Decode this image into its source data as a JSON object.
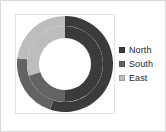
{
  "chart_data": {
    "type": "pie",
    "subtype": "doughnut",
    "title": "",
    "xlabel": "",
    "ylabel": "",
    "grid": false,
    "legend_position": "right",
    "categories": [
      "North",
      "South",
      "East"
    ],
    "colors": {
      "North": "#3b3b3b",
      "South": "#636363",
      "East": "#bdbdbd"
    },
    "rings": [
      {
        "name": "Outer ring",
        "start_angle": 0,
        "values": [
          55,
          22,
          23
        ],
        "slices": [
          {
            "label": "North",
            "value": 55,
            "percent": 55,
            "color": "#3b3b3b",
            "start_deg": 0,
            "end_deg": 198
          },
          {
            "label": "South",
            "value": 22,
            "percent": 22,
            "color": "#636363",
            "start_deg": 198,
            "end_deg": 277
          },
          {
            "label": "East",
            "value": 23,
            "percent": 23,
            "color": "#bdbdbd",
            "start_deg": 277,
            "end_deg": 360
          }
        ]
      },
      {
        "name": "Inner ring",
        "start_angle": 0,
        "values": [
          50,
          20,
          30
        ],
        "slices": [
          {
            "label": "North",
            "value": 50,
            "percent": 50,
            "color": "#3b3b3b",
            "start_deg": 0,
            "end_deg": 180
          },
          {
            "label": "South",
            "value": 20,
            "percent": 20,
            "color": "#636363",
            "start_deg": 180,
            "end_deg": 252
          },
          {
            "label": "East",
            "value": 30,
            "percent": 30,
            "color": "#bdbdbd",
            "start_deg": 252,
            "end_deg": 360
          }
        ]
      }
    ],
    "geometry": {
      "center_x": 50,
      "center_y": 50,
      "outer_radius": 48,
      "ring_split_radius": 38,
      "inner_radius": 26
    }
  },
  "legend": {
    "items": [
      {
        "label": "North",
        "color": "#3b3b3b"
      },
      {
        "label": "South",
        "color": "#636363"
      },
      {
        "label": "East",
        "color": "#bdbdbd"
      }
    ]
  }
}
